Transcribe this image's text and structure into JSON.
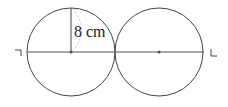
{
  "diagram": {
    "type": "two tangent circles with common diameter line",
    "radius_label": "8 cm",
    "circles": [
      {
        "cx": 71,
        "cy": 52,
        "r": 44
      },
      {
        "cx": 159,
        "cy": 52,
        "r": 44
      }
    ],
    "line": {
      "x1": 27,
      "y1": 52,
      "x2": 204,
      "y2": 52
    },
    "radius_segment": {
      "x1": 71,
      "y1": 8,
      "x2": 71,
      "y2": 52
    },
    "end_marks": [
      "left-corner-mark",
      "right-corner-mark"
    ],
    "colors": {
      "stroke": "#444444",
      "dashed": "#bbbbbb",
      "dot": "#555555"
    }
  }
}
